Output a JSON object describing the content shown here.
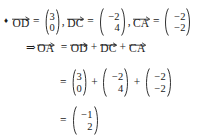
{
  "document": {
    "type": "math-worked-solution",
    "background_color": "#ffffff",
    "text_color": "#1a1a1a",
    "bullet_glyph": "♦"
  },
  "symbols": {
    "implies": "⇒",
    "equals": "=",
    "plus": "+",
    "comma": ",",
    "arrow": "vector-arrow-icon"
  },
  "lines": [
    {
      "id": "line-1",
      "bullet": "♦",
      "items": [
        {
          "kind": "vector-symbol",
          "label": "OD"
        },
        {
          "kind": "operator",
          "text": "="
        },
        {
          "kind": "column-vector",
          "top": "3",
          "bottom": "0"
        },
        {
          "kind": "punctuation",
          "text": ","
        },
        {
          "kind": "vector-symbol",
          "label": "DC"
        },
        {
          "kind": "operator",
          "text": "="
        },
        {
          "kind": "column-vector",
          "top": "−2",
          "bottom": "4"
        },
        {
          "kind": "punctuation",
          "text": ","
        },
        {
          "kind": "vector-symbol",
          "label": "CA"
        },
        {
          "kind": "operator",
          "text": "="
        },
        {
          "kind": "column-vector",
          "top": "−2",
          "bottom": "−2"
        }
      ]
    },
    {
      "id": "line-2",
      "items": [
        {
          "kind": "operator",
          "text": "⇒"
        },
        {
          "kind": "vector-symbol",
          "label": "OA"
        },
        {
          "kind": "operator",
          "text": "="
        },
        {
          "kind": "vector-symbol",
          "label": "OD"
        },
        {
          "kind": "operator",
          "text": "+"
        },
        {
          "kind": "vector-symbol",
          "label": "DC"
        },
        {
          "kind": "operator",
          "text": "+"
        },
        {
          "kind": "vector-symbol",
          "label": "CA"
        }
      ]
    },
    {
      "id": "line-3",
      "items": [
        {
          "kind": "operator",
          "text": "="
        },
        {
          "kind": "column-vector",
          "top": "3",
          "bottom": "0"
        },
        {
          "kind": "operator",
          "text": "+"
        },
        {
          "kind": "column-vector",
          "top": "−2",
          "bottom": "4"
        },
        {
          "kind": "operator",
          "text": "+"
        },
        {
          "kind": "column-vector",
          "top": "−2",
          "bottom": "−2"
        }
      ]
    },
    {
      "id": "line-4",
      "items": [
        {
          "kind": "operator",
          "text": "="
        },
        {
          "kind": "column-vector",
          "top": "−1",
          "bottom": "2"
        }
      ]
    }
  ],
  "line1": {
    "bullet": "♦",
    "vec_od": "OD",
    "eq1": "=",
    "v1_top": "3",
    "v1_bottom": "0",
    "comma1": ",",
    "vec_dc": "DC",
    "eq2": "=",
    "v2_top": "−2",
    "v2_bottom": "4",
    "comma2": ",",
    "vec_ca": "CA",
    "eq3": "=",
    "v3_top": "−2",
    "v3_bottom": "−2"
  },
  "line2": {
    "implies": "⇒",
    "vec_oa": "OA",
    "eq": "=",
    "vec_od": "OD",
    "plus1": "+",
    "vec_dc": "DC",
    "plus2": "+",
    "vec_ca": "CA"
  },
  "line3": {
    "eq": "=",
    "v1_top": "3",
    "v1_bottom": "0",
    "plus1": "+",
    "v2_top": "−2",
    "v2_bottom": "4",
    "plus2": "+",
    "v3_top": "−2",
    "v3_bottom": "−2"
  },
  "line4": {
    "eq": "=",
    "result_top": "−1",
    "result_bottom": "2"
  }
}
